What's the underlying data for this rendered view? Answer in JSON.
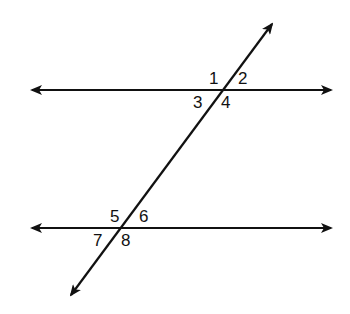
{
  "diagram": {
    "type": "parallel lines cut by a transversal",
    "lines": [
      {
        "id": "top-parallel-line",
        "kind": "line",
        "arrows": "both"
      },
      {
        "id": "bottom-parallel-line",
        "kind": "line",
        "arrows": "both"
      },
      {
        "id": "transversal",
        "kind": "line",
        "arrows": "both"
      }
    ],
    "angle_labels": {
      "top": [
        "1",
        "2",
        "3",
        "4"
      ],
      "bottom": [
        "5",
        "6",
        "7",
        "8"
      ]
    },
    "colors": {
      "stroke": "#111111",
      "background": "#ffffff"
    }
  }
}
